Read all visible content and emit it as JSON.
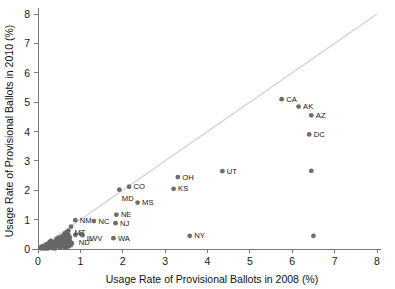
{
  "chart_data": {
    "type": "scatter",
    "title": "",
    "xlabel": "Usage Rate of Provisional Ballots in 2008 (%)",
    "ylabel": "Usage Rate of Provisional Ballots in 2010 (%)",
    "xlim": [
      0,
      8
    ],
    "ylim": [
      0,
      8
    ],
    "xticks": [
      0,
      1,
      2,
      3,
      4,
      5,
      6,
      7,
      8
    ],
    "yticks": [
      0,
      1,
      2,
      3,
      4,
      5,
      6,
      7,
      8
    ],
    "xtick_labels": [
      "0",
      "1",
      "2",
      "3",
      "4",
      "5",
      "6",
      "7",
      "8"
    ],
    "ytick_labels": [
      "0",
      "1",
      "2",
      "3",
      "4",
      "5",
      "6",
      "7",
      "8"
    ],
    "grid": false,
    "legend": "none",
    "marker_color": "#6e6e6e",
    "reference_line": {
      "name": "identity-line",
      "description": "y = x diagonal reference line",
      "from": [
        0,
        0
      ],
      "to": [
        8,
        8
      ],
      "color": "#cfcfcf"
    },
    "points": [
      {
        "label": "CA",
        "x": 5.75,
        "y": 5.1
      },
      {
        "label": "AK",
        "x": 6.15,
        "y": 4.85
      },
      {
        "label": "AZ",
        "x": 6.45,
        "y": 4.55
      },
      {
        "label": "DC",
        "x": 6.4,
        "y": 3.9
      },
      {
        "label": "UT",
        "x": 4.35,
        "y": 2.65
      },
      {
        "label": "OH",
        "x": 3.3,
        "y": 2.45
      },
      {
        "label": "KS",
        "x": 3.2,
        "y": 2.05
      },
      {
        "label": "CO",
        "x": 2.15,
        "y": 2.12
      },
      {
        "label": "MD",
        "x": 1.92,
        "y": 2.02
      },
      {
        "label": "MS",
        "x": 2.35,
        "y": 1.58
      },
      {
        "label": "NE",
        "x": 1.85,
        "y": 1.17
      },
      {
        "label": "NJ",
        "x": 1.83,
        "y": 0.88
      },
      {
        "label": "NY",
        "x": 3.58,
        "y": 0.45
      },
      {
        "label": "WA",
        "x": 1.78,
        "y": 0.37
      },
      {
        "label": "NM",
        "x": 0.88,
        "y": 0.98
      },
      {
        "label": "NC",
        "x": 1.32,
        "y": 0.95
      },
      {
        "label": "MT",
        "x": 0.78,
        "y": 0.76
      },
      {
        "label": "ND",
        "x": 0.88,
        "y": 0.48
      },
      {
        "label": "IL",
        "x": 1.02,
        "y": 0.5
      },
      {
        "label": "WV",
        "x": 1.05,
        "y": 0.47
      },
      {
        "label": "",
        "x": 6.45,
        "y": 2.66
      },
      {
        "label": "",
        "x": 6.5,
        "y": 0.45
      }
    ],
    "cluster_note": "dense unlabeled cluster of remaining states near the origin (0 to ~0.8 on both axes)",
    "cluster_points": [
      {
        "x": 0.05,
        "y": 0.03
      },
      {
        "x": 0.08,
        "y": 0.05
      },
      {
        "x": 0.1,
        "y": 0.02
      },
      {
        "x": 0.12,
        "y": 0.07
      },
      {
        "x": 0.13,
        "y": 0.04
      },
      {
        "x": 0.15,
        "y": 0.09
      },
      {
        "x": 0.16,
        "y": 0.03
      },
      {
        "x": 0.18,
        "y": 0.12
      },
      {
        "x": 0.19,
        "y": 0.06
      },
      {
        "x": 0.21,
        "y": 0.1
      },
      {
        "x": 0.22,
        "y": 0.15
      },
      {
        "x": 0.24,
        "y": 0.05
      },
      {
        "x": 0.25,
        "y": 0.18
      },
      {
        "x": 0.26,
        "y": 0.08
      },
      {
        "x": 0.28,
        "y": 0.13
      },
      {
        "x": 0.29,
        "y": 0.21
      },
      {
        "x": 0.31,
        "y": 0.06
      },
      {
        "x": 0.32,
        "y": 0.16
      },
      {
        "x": 0.33,
        "y": 0.11
      },
      {
        "x": 0.35,
        "y": 0.24
      },
      {
        "x": 0.36,
        "y": 0.09
      },
      {
        "x": 0.38,
        "y": 0.18
      },
      {
        "x": 0.39,
        "y": 0.14
      },
      {
        "x": 0.41,
        "y": 0.27
      },
      {
        "x": 0.42,
        "y": 0.07
      },
      {
        "x": 0.43,
        "y": 0.2
      },
      {
        "x": 0.45,
        "y": 0.12
      },
      {
        "x": 0.46,
        "y": 0.3
      },
      {
        "x": 0.47,
        "y": 0.16
      },
      {
        "x": 0.49,
        "y": 0.23
      },
      {
        "x": 0.5,
        "y": 0.1
      },
      {
        "x": 0.51,
        "y": 0.33
      },
      {
        "x": 0.53,
        "y": 0.19
      },
      {
        "x": 0.54,
        "y": 0.26
      },
      {
        "x": 0.55,
        "y": 0.14
      },
      {
        "x": 0.57,
        "y": 0.36
      },
      {
        "x": 0.58,
        "y": 0.22
      },
      {
        "x": 0.59,
        "y": 0.29
      },
      {
        "x": 0.61,
        "y": 0.17
      },
      {
        "x": 0.62,
        "y": 0.4
      },
      {
        "x": 0.63,
        "y": 0.25
      },
      {
        "x": 0.65,
        "y": 0.32
      },
      {
        "x": 0.66,
        "y": 0.2
      },
      {
        "x": 0.67,
        "y": 0.44
      },
      {
        "x": 0.69,
        "y": 0.28
      },
      {
        "x": 0.7,
        "y": 0.36
      },
      {
        "x": 0.71,
        "y": 0.23
      },
      {
        "x": 0.72,
        "y": 0.48
      },
      {
        "x": 0.74,
        "y": 0.31
      },
      {
        "x": 0.75,
        "y": 0.4
      },
      {
        "x": 0.63,
        "y": 0.53
      },
      {
        "x": 0.68,
        "y": 0.58
      },
      {
        "x": 0.72,
        "y": 0.62
      },
      {
        "x": 0.6,
        "y": 0.46
      },
      {
        "x": 0.55,
        "y": 0.42
      },
      {
        "x": 0.48,
        "y": 0.38
      },
      {
        "x": 0.44,
        "y": 0.34
      },
      {
        "x": 0.3,
        "y": 0.28
      },
      {
        "x": 0.27,
        "y": 0.24
      },
      {
        "x": 0.2,
        "y": 0.17
      },
      {
        "x": 0.14,
        "y": 0.11
      },
      {
        "x": 0.09,
        "y": 0.08
      },
      {
        "x": 0.06,
        "y": 0.06
      },
      {
        "x": 0.35,
        "y": 0.03
      },
      {
        "x": 0.52,
        "y": 0.05
      },
      {
        "x": 0.6,
        "y": 0.08
      },
      {
        "x": 0.66,
        "y": 0.04
      },
      {
        "x": 0.73,
        "y": 0.09
      },
      {
        "x": 0.78,
        "y": 0.14
      },
      {
        "x": 0.8,
        "y": 0.2
      },
      {
        "x": 0.76,
        "y": 0.26
      },
      {
        "x": 0.7,
        "y": 0.12
      },
      {
        "x": 0.4,
        "y": 0.02
      },
      {
        "x": 0.23,
        "y": 0.02
      },
      {
        "x": 0.17,
        "y": 0.02
      }
    ]
  }
}
